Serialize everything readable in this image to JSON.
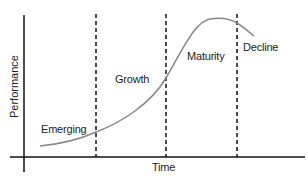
{
  "diagram": {
    "x_axis_label": "Time",
    "y_axis_label": "Performance",
    "stages": [
      {
        "label": "Emerging"
      },
      {
        "label": "Growth"
      },
      {
        "label": "Maturity"
      },
      {
        "label": "Decline"
      }
    ],
    "curve_color": "#888888",
    "axis_color": "#111111",
    "divider_style": "dashed"
  }
}
